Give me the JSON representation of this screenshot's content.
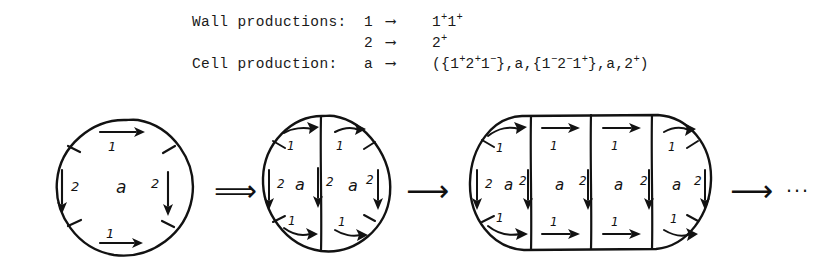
{
  "figure": {
    "title_present": false,
    "background_color": "#ffffff",
    "ink_color": "#121212"
  },
  "rules": {
    "wall": {
      "label": "Wall productions:",
      "productions": [
        {
          "lhs": "1",
          "arrow": "⟶",
          "rhs_parts": [
            {
              "base": "1",
              "sup": "+"
            },
            {
              "base": "1",
              "sup": "+"
            }
          ]
        },
        {
          "lhs": "2",
          "arrow": "⟶",
          "rhs_parts": [
            {
              "base": "2",
              "sup": "+"
            }
          ]
        }
      ]
    },
    "cell": {
      "label": "Cell production:",
      "production": {
        "lhs": "a",
        "arrow": "⟶",
        "rhs_parts": [
          {
            "base": "({1",
            "sup": ""
          },
          {
            "base": "",
            "sup": "+"
          },
          {
            "base": "2",
            "sup": "+"
          },
          {
            "base": "1",
            "sup": "−"
          },
          {
            "base": "},a,{1",
            "sup": "−"
          },
          {
            "base": "2",
            "sup": "−"
          },
          {
            "base": "1",
            "sup": "+"
          },
          {
            "base": "},a,2",
            "sup": "+"
          },
          {
            "base": ")",
            "sup": ""
          }
        ],
        "rhs_plain": "({1+2+1-},a,{1-2-1+},a,2+)"
      }
    }
  },
  "derivation": {
    "steps": [
      {
        "name": "step-1-single-cell",
        "shape": "circle",
        "cell_count": 1,
        "cells": [
          {
            "center_label": "a",
            "top_wall": {
              "label": "1",
              "direction": "right"
            },
            "bottom_wall": {
              "label": "1",
              "direction": "right"
            },
            "left_wall": {
              "label": "2",
              "direction": "down"
            },
            "right_wall": {
              "label": "2",
              "direction": "down"
            }
          }
        ]
      },
      {
        "name": "step-2-two-cells",
        "shape": "circle-split",
        "cell_count": 2,
        "cells": [
          {
            "center_label": "a",
            "top_wall": {
              "label": "1",
              "direction": "right"
            },
            "bottom_wall": {
              "label": "1",
              "direction": "right"
            },
            "left_wall": {
              "label": "2",
              "direction": "down"
            },
            "right_wall": {
              "label": "2",
              "direction": "down"
            }
          },
          {
            "center_label": "a",
            "top_wall": {
              "label": "1",
              "direction": "right"
            },
            "bottom_wall": {
              "label": "1",
              "direction": "right"
            },
            "left_wall": {
              "label": "2",
              "direction": "down"
            },
            "right_wall": {
              "label": "2",
              "direction": "down"
            }
          }
        ]
      },
      {
        "name": "step-3-four-cells",
        "shape": "stadium-split",
        "cell_count": 4,
        "cells": [
          {
            "center_label": "a",
            "top_wall": {
              "label": "1",
              "direction": "right"
            },
            "bottom_wall": {
              "label": "1",
              "direction": "right"
            },
            "left_wall": {
              "label": "2",
              "direction": "down"
            },
            "right_wall": {
              "label": "2",
              "direction": "down"
            }
          },
          {
            "center_label": "a",
            "top_wall": {
              "label": "1",
              "direction": "right"
            },
            "bottom_wall": {
              "label": "1",
              "direction": "right"
            },
            "left_wall": {
              "label": "2",
              "direction": "down"
            },
            "right_wall": {
              "label": "2",
              "direction": "down"
            }
          },
          {
            "center_label": "a",
            "top_wall": {
              "label": "1",
              "direction": "right"
            },
            "bottom_wall": {
              "label": "1",
              "direction": "right"
            },
            "left_wall": {
              "label": "2",
              "direction": "down"
            },
            "right_wall": {
              "label": "2",
              "direction": "down"
            }
          },
          {
            "center_label": "a",
            "top_wall": {
              "label": "1",
              "direction": "right"
            },
            "bottom_wall": {
              "label": "1",
              "direction": "right"
            },
            "left_wall": {
              "label": "2",
              "direction": "down"
            },
            "right_wall": {
              "label": "2",
              "direction": "down"
            }
          }
        ]
      }
    ],
    "operators": [
      {
        "name": "double-arrow",
        "glyph": "⟹"
      },
      {
        "name": "single-arrow",
        "glyph": "⟶"
      },
      {
        "name": "single-arrow",
        "glyph": "⟶"
      },
      {
        "name": "ellipsis",
        "glyph": "···"
      }
    ]
  }
}
